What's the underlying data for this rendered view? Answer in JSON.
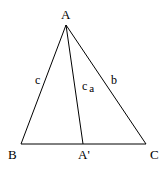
{
  "diagram": {
    "vertices": {
      "A": {
        "label": "A",
        "x": 66,
        "y": 25
      },
      "B": {
        "label": "B",
        "x": 21,
        "y": 144
      },
      "C": {
        "label": "C",
        "x": 146,
        "y": 144
      },
      "A_prime": {
        "label": "A'",
        "x": 83,
        "y": 144
      }
    },
    "sides": {
      "c": {
        "label": "c"
      },
      "b": {
        "label": "b"
      },
      "ca": {
        "label": "c",
        "subscript": "a"
      }
    },
    "colors": {
      "stroke": "#000000",
      "background": "#ffffff"
    }
  }
}
